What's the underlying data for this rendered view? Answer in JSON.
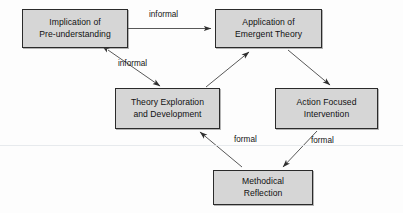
{
  "diagram": {
    "type": "flow-diagram",
    "canvas": {
      "width": 403,
      "height": 213
    },
    "style": {
      "node_fill": "#d6d6d6",
      "node_border": "#2b2b2b",
      "edge_color": "#3a3a3a",
      "text_color": "#111111",
      "background": "#fdfdfd",
      "artifact_color": "#e3e6ea"
    },
    "nodes": [
      {
        "id": "implication-pre-understanding",
        "label": "Implication of\nPre-understanding",
        "x": 22,
        "y": 9,
        "width": 106,
        "height": 39
      },
      {
        "id": "application-emergent-theory",
        "label": "Application of\nEmergent Theory",
        "x": 215,
        "y": 9,
        "width": 107,
        "height": 39
      },
      {
        "id": "theory-exploration-development",
        "label": "Theory Exploration\nand Development",
        "x": 115,
        "y": 88,
        "width": 105,
        "height": 41
      },
      {
        "id": "action-focused-intervention",
        "label": "Action Focused\nIntervention",
        "x": 275,
        "y": 88,
        "width": 103,
        "height": 41
      },
      {
        "id": "methodical-reflection",
        "label": "Methodical\nReflection",
        "x": 213,
        "y": 170,
        "width": 100,
        "height": 35
      }
    ],
    "edges": [
      {
        "id": "edge-implication-to-application",
        "from": "implication-pre-understanding",
        "to": "application-emergent-theory",
        "label": "informal",
        "label_x": 149,
        "label_y": 11,
        "arrowheads": "end"
      },
      {
        "id": "edge-implication-theory-bidirectional",
        "from": "implication-pre-understanding",
        "to": "theory-exploration-development",
        "label": "informal",
        "label_x": 118,
        "label_y": 60,
        "arrowheads": "both"
      },
      {
        "id": "edge-theory-to-application",
        "from": "theory-exploration-development",
        "to": "application-emergent-theory",
        "label": "",
        "arrowheads": "end"
      },
      {
        "id": "edge-application-to-action",
        "from": "application-emergent-theory",
        "to": "action-focused-intervention",
        "label": "",
        "arrowheads": "end"
      },
      {
        "id": "edge-action-to-reflection",
        "from": "action-focused-intervention",
        "to": "methodical-reflection",
        "label": "formal",
        "label_x": 311,
        "label_y": 137,
        "arrowheads": "end"
      },
      {
        "id": "edge-reflection-to-theory",
        "from": "methodical-reflection",
        "to": "theory-exploration-development",
        "label": "formal",
        "label_x": 234,
        "label_y": 136,
        "arrowheads": "end"
      }
    ]
  }
}
